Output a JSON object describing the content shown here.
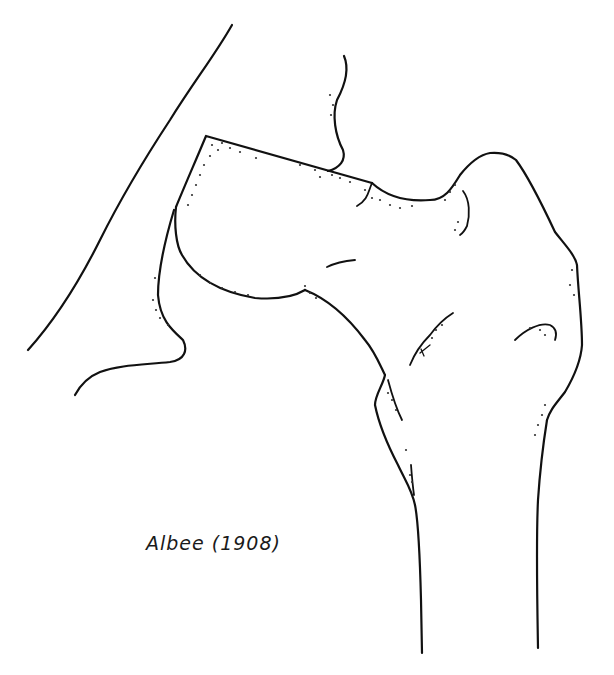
{
  "figure": {
    "caption": "Albee (1908)",
    "line_color": "#111111",
    "background": "#ffffff"
  }
}
